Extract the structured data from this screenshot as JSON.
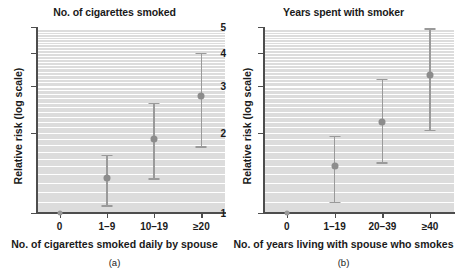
{
  "figure": {
    "panels": [
      {
        "key": "a",
        "title": "No. of cigarettes smoked",
        "caption": "(a)",
        "xlabel": "No. of cigarettes smoked daily by spouse",
        "ylabel": "Relative risk (log scale)"
      },
      {
        "key": "b",
        "title": "Years spent with smoker",
        "caption": "(b)",
        "xlabel": "No. of years living with spouse who smokes",
        "ylabel": "Relative risk (log scale)"
      }
    ],
    "colors": {
      "panel_background": "#dcdcdc",
      "gridline": "#ffffff",
      "axis": "#4d4d4d",
      "marker": "#8c8c8c",
      "errorbar": "#9a9a9a",
      "text": "#1a1a1a"
    }
  },
  "chart_data": [
    {
      "type": "scatter",
      "title": "No. of cigarettes smoked",
      "caption": "(a)",
      "xlabel": "No. of cigarettes smoked daily by spouse",
      "ylabel": "Relative risk (log scale)",
      "yscale": "log",
      "ylim": [
        1,
        5
      ],
      "yticks": [
        1,
        2,
        3,
        4,
        5
      ],
      "ytick_labels": [
        "1",
        "2",
        "3",
        "4",
        "5"
      ],
      "grid": true,
      "legend": "none",
      "categories": [
        "0",
        "1–9",
        "10–19",
        "≥20"
      ],
      "values": [
        1.0,
        1.35,
        1.9,
        2.75
      ],
      "ci_lower": [
        1.0,
        1.07,
        1.35,
        1.78
      ],
      "ci_upper": [
        1.0,
        1.65,
        2.6,
        4.0
      ],
      "reference_category": "0"
    },
    {
      "type": "scatter",
      "title": "Years spent with smoker",
      "caption": "(b)",
      "xlabel": "No. of years living with spouse who smokes",
      "ylabel": "Relative risk (log scale)",
      "yscale": "log",
      "ylim": [
        1,
        5
      ],
      "yticks": [
        1,
        2,
        3,
        4,
        5
      ],
      "ytick_labels": [
        "1",
        "2",
        "3",
        "4",
        "5"
      ],
      "grid": true,
      "legend": "none",
      "categories": [
        "0",
        "1–19",
        "20–39",
        "≥40"
      ],
      "values": [
        1.0,
        1.5,
        2.2,
        3.3
      ],
      "ci_lower": [
        1.0,
        1.1,
        1.55,
        2.05
      ],
      "ci_upper": [
        1.0,
        1.95,
        3.2,
        4.95
      ],
      "reference_category": "0"
    }
  ]
}
